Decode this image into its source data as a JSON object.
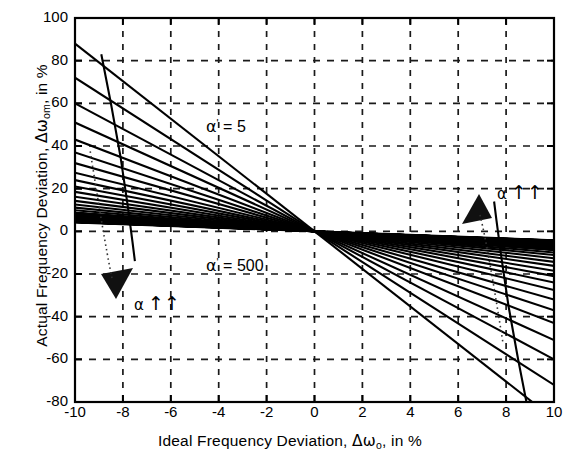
{
  "chart_data": {
    "type": "line",
    "title": "",
    "xlabel": "Ideal Frequency Deviation, Δωo, in %",
    "ylabel": "Actual Frequency Deviation, Δωom, in %",
    "xlim": [
      -10,
      10
    ],
    "ylim": [
      -80,
      100
    ],
    "xticks": [
      -10,
      -8,
      -6,
      -4,
      -2,
      0,
      2,
      4,
      6,
      8,
      10
    ],
    "yticks": [
      -80,
      -60,
      -40,
      -20,
      0,
      20,
      40,
      60,
      80,
      100
    ],
    "grid": true,
    "grid_style": "dashed",
    "legend": "none",
    "parameter_name": "α'",
    "parameter_min": 5,
    "parameter_max": 500,
    "series": [
      {
        "name": "α' = 5",
        "slope": -8.8,
        "x": [
          -10,
          10
        ],
        "y": [
          88,
          -88
        ]
      },
      {
        "name": "α' = 7",
        "slope": -7.2,
        "x": [
          -10,
          10
        ],
        "y": [
          72,
          -72
        ]
      },
      {
        "name": "α' = 9",
        "slope": -6.0,
        "x": [
          -10,
          10
        ],
        "y": [
          60,
          -60
        ]
      },
      {
        "name": "α' = 11",
        "slope": -5.1,
        "x": [
          -10,
          10
        ],
        "y": [
          51,
          -51
        ]
      },
      {
        "name": "α' = 14",
        "slope": -4.3,
        "x": [
          -10,
          10
        ],
        "y": [
          43,
          -43
        ]
      },
      {
        "name": "α' = 17",
        "slope": -3.7,
        "x": [
          -10,
          10
        ],
        "y": [
          37,
          -37
        ]
      },
      {
        "name": "α' = 21",
        "slope": -3.2,
        "x": [
          -10,
          10
        ],
        "y": [
          32,
          -32
        ]
      },
      {
        "name": "α' = 26",
        "slope": -2.75,
        "x": [
          -10,
          10
        ],
        "y": [
          27.5,
          -27.5
        ]
      },
      {
        "name": "α' = 32",
        "slope": -2.4,
        "x": [
          -10,
          10
        ],
        "y": [
          24,
          -24
        ]
      },
      {
        "name": "α' = 39",
        "slope": -2.1,
        "x": [
          -10,
          10
        ],
        "y": [
          21,
          -21
        ]
      },
      {
        "name": "α' = 48",
        "slope": -1.85,
        "x": [
          -10,
          10
        ],
        "y": [
          18.5,
          -18.5
        ]
      },
      {
        "name": "α' = 59",
        "slope": -1.62,
        "x": [
          -10,
          10
        ],
        "y": [
          16.2,
          -16.2
        ]
      },
      {
        "name": "α' = 72",
        "slope": -1.43,
        "x": [
          -10,
          10
        ],
        "y": [
          14.3,
          -14.3
        ]
      },
      {
        "name": "α' = 88",
        "slope": -1.26,
        "x": [
          -10,
          10
        ],
        "y": [
          12.6,
          -12.6
        ]
      },
      {
        "name": "α' = 108",
        "slope": -1.11,
        "x": [
          -10,
          10
        ],
        "y": [
          11.1,
          -11.1
        ]
      },
      {
        "name": "α' = 132",
        "slope": -0.99,
        "x": [
          -10,
          10
        ],
        "y": [
          9.9,
          -9.9
        ]
      },
      {
        "name": "α' = 162",
        "slope": -0.87,
        "x": [
          -10,
          10
        ],
        "y": [
          8.7,
          -8.7
        ]
      },
      {
        "name": "α' = 198",
        "slope": -0.77,
        "x": [
          -10,
          10
        ],
        "y": [
          7.7,
          -7.7
        ]
      },
      {
        "name": "α' = 243",
        "slope": -0.68,
        "x": [
          -10,
          10
        ],
        "y": [
          6.8,
          -6.8
        ]
      },
      {
        "name": "α' = 298",
        "slope": -0.6,
        "x": [
          -10,
          10
        ],
        "y": [
          6.0,
          -6.0
        ]
      },
      {
        "name": "α' = 365",
        "slope": -0.53,
        "x": [
          -10,
          10
        ],
        "y": [
          5.3,
          -5.3
        ]
      },
      {
        "name": "α' = 447",
        "slope": -0.47,
        "x": [
          -10,
          10
        ],
        "y": [
          4.7,
          -4.7
        ]
      },
      {
        "name": "α' = 500",
        "slope": -0.42,
        "x": [
          -10,
          10
        ],
        "y": [
          4.2,
          -4.2
        ]
      }
    ],
    "envelope_curves": [
      {
        "name": "envelope-upper-left",
        "x": [
          -8.9,
          -8.5,
          -8.1,
          -7.8,
          -7.6,
          -7.5
        ],
        "y": [
          83,
          60,
          35,
          12,
          -5,
          -14
        ]
      },
      {
        "name": "envelope-lower-right",
        "x": [
          8.9,
          8.5,
          8.1,
          7.8,
          7.6,
          7.5
        ],
        "y": [
          -83,
          -60,
          -35,
          -12,
          5,
          14
        ]
      }
    ]
  },
  "axes": {
    "x_title_parts": {
      "main": "Ideal Frequency Deviation, ",
      "symbol": "Δω",
      "sub": "o",
      "tail": ", in %"
    },
    "y_title_parts": {
      "main": "Actual Frequency Deviation, ",
      "symbol": "Δω",
      "sub": "om",
      "tail": ", in %"
    },
    "xticklabels": [
      "-10",
      "-8",
      "-6",
      "-4",
      "-2",
      "0",
      "2",
      "4",
      "6",
      "8",
      "10"
    ],
    "yticklabels": [
      "100",
      "80",
      "60",
      "40",
      "20",
      "0",
      "-20",
      "-40",
      "-60",
      "-80"
    ]
  },
  "annotations": {
    "alpha_min_label": {
      "symbol": "α",
      "prime": "'",
      "equals": " = ",
      "value": "5"
    },
    "alpha_max_label": {
      "symbol": "α",
      "prime": "'",
      "equals": " = ",
      "value": "500"
    },
    "alpha_arrow_left": {
      "symbol": "α",
      "arrows": "↑↑"
    },
    "alpha_arrow_right": {
      "symbol": "α",
      "arrows": "↑↑"
    }
  },
  "colors": {
    "ink": "#000000",
    "background": "#ffffff",
    "grid": "#1a1a1a"
  }
}
